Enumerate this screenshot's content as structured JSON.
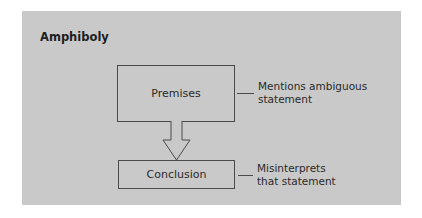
{
  "diagram": {
    "title": "Amphiboly",
    "nodes": [
      {
        "id": "premises",
        "label": "Premises"
      },
      {
        "id": "conclusion",
        "label": "Conclusion"
      }
    ],
    "edges": [
      {
        "from": "premises",
        "to": "conclusion",
        "type": "hollow-arrow"
      }
    ],
    "annotations": {
      "premises": {
        "line1": "Mentions ambiguous",
        "line2": "statement"
      },
      "conclusion": {
        "line1": "Misinterprets",
        "line2": "that statement"
      }
    },
    "colors": {
      "panel": "#c9c9c9",
      "stroke": "#4a4a4a",
      "text": "#2a2a2a"
    }
  }
}
